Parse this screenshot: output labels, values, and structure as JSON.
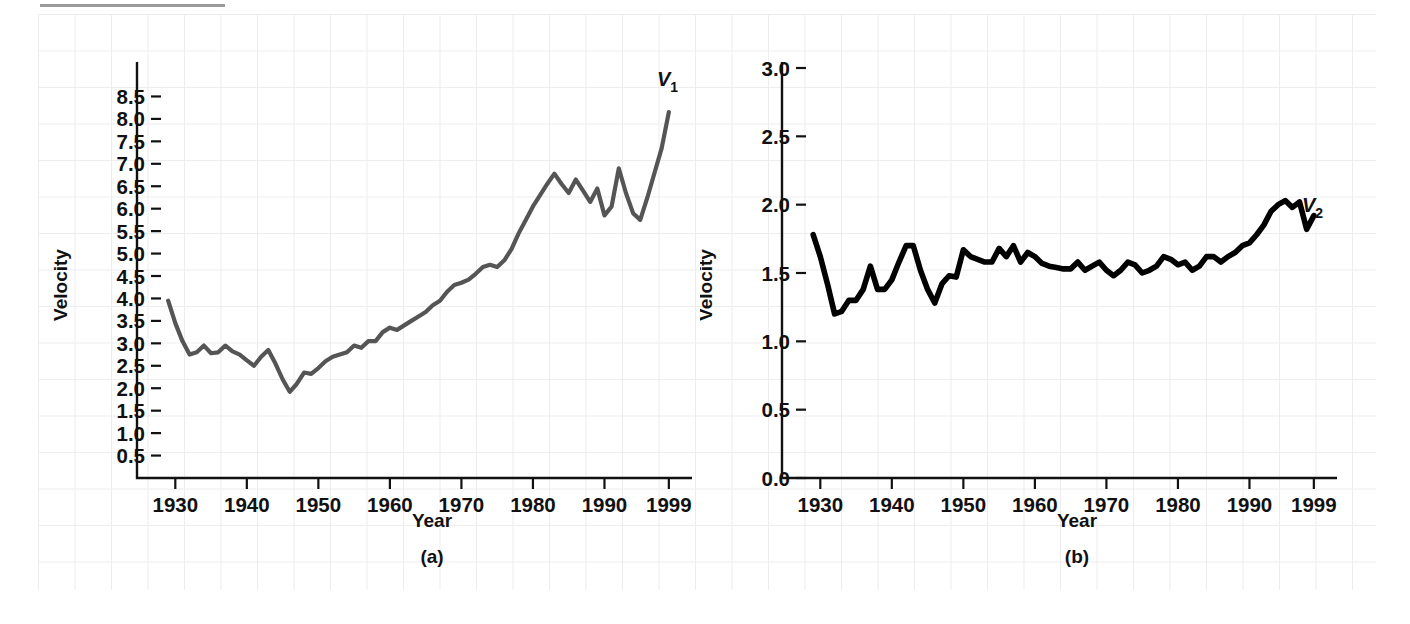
{
  "figure": {
    "panels": [
      {
        "caption": "(a)",
        "xlabel": "Year",
        "ylabel": "Velocity",
        "series_label": "V",
        "series_sub": "1",
        "line_color": "#555555"
      },
      {
        "caption": "(b)",
        "xlabel": "Year",
        "ylabel": "Velocity",
        "series_label": "V",
        "series_sub": "2",
        "line_color": "#000000"
      }
    ]
  },
  "chart_data": [
    {
      "type": "line",
      "title": "",
      "panel": "(a)",
      "xlabel": "Year",
      "ylabel": "Velocity",
      "xlim": [
        1928,
        2000
      ],
      "ylim": [
        0,
        8.8
      ],
      "grid": true,
      "legend_position": "end-of-line",
      "xticks": [
        1930,
        1940,
        1950,
        1960,
        1970,
        1980,
        1990,
        1999
      ],
      "xticklabels": [
        "1930",
        "1940",
        "1950",
        "1960",
        "1970",
        "1980",
        "1990",
        "1999"
      ],
      "yticks": [
        0.5,
        1.0,
        1.5,
        2.0,
        2.5,
        3.0,
        3.5,
        4.0,
        4.5,
        5.0,
        5.5,
        6.0,
        6.5,
        7.0,
        7.5,
        8.0,
        8.5
      ],
      "yticklabels": [
        "0.5",
        "1.0",
        "1.5",
        "2.0",
        "2.5",
        "3.0",
        "3.5",
        "4.0",
        "4.5",
        "5.0",
        "5.5",
        "6.0",
        "6.5",
        "7.0",
        "7.5",
        "8.0",
        "8.5"
      ],
      "series": [
        {
          "name": "V1",
          "annotation": "V₁",
          "x": [
            1929,
            1930,
            1931,
            1932,
            1933,
            1934,
            1935,
            1936,
            1937,
            1938,
            1939,
            1940,
            1941,
            1942,
            1943,
            1944,
            1945,
            1946,
            1947,
            1948,
            1949,
            1950,
            1951,
            1952,
            1953,
            1954,
            1955,
            1956,
            1957,
            1958,
            1959,
            1960,
            1961,
            1962,
            1963,
            1964,
            1965,
            1966,
            1967,
            1968,
            1969,
            1970,
            1971,
            1972,
            1973,
            1974,
            1975,
            1976,
            1977,
            1978,
            1979,
            1980,
            1981,
            1982,
            1983,
            1984,
            1985,
            1986,
            1987,
            1988,
            1989,
            1990,
            1991,
            1992,
            1993,
            1994,
            1995,
            1996,
            1997,
            1998,
            1999
          ],
          "values": [
            3.95,
            3.45,
            3.05,
            2.75,
            2.8,
            2.95,
            2.78,
            2.8,
            2.95,
            2.82,
            2.75,
            2.62,
            2.5,
            2.7,
            2.85,
            2.55,
            2.2,
            1.92,
            2.1,
            2.35,
            2.32,
            2.45,
            2.6,
            2.7,
            2.75,
            2.8,
            2.95,
            2.9,
            3.05,
            3.05,
            3.25,
            3.35,
            3.3,
            3.4,
            3.5,
            3.6,
            3.7,
            3.85,
            3.95,
            4.15,
            4.3,
            4.35,
            4.42,
            4.55,
            4.7,
            4.75,
            4.7,
            4.85,
            5.1,
            5.45,
            5.75,
            6.05,
            6.3,
            6.55,
            6.78,
            6.55,
            6.35,
            6.65,
            6.4,
            6.15,
            6.45,
            5.85,
            6.05,
            6.9,
            6.35,
            5.9,
            5.75,
            6.25,
            6.8,
            7.35,
            8.15
          ]
        }
      ]
    },
    {
      "type": "line",
      "title": "",
      "panel": "(b)",
      "xlabel": "Year",
      "ylabel": "Velocity",
      "xlim": [
        1928,
        2000
      ],
      "ylim": [
        0.0,
        3.0
      ],
      "grid": true,
      "legend_position": "end-of-line",
      "xticks": [
        1930,
        1940,
        1950,
        1960,
        1970,
        1980,
        1990,
        1999
      ],
      "xticklabels": [
        "1930",
        "1940",
        "1950",
        "1960",
        "1970",
        "1980",
        "1990",
        "1999"
      ],
      "yticks": [
        0.0,
        0.5,
        1.0,
        1.5,
        2.0,
        2.5,
        3.0
      ],
      "yticklabels": [
        "0.0",
        "0.5",
        "1.0",
        "1.5",
        "2.0",
        "2.5",
        "3.0"
      ],
      "series": [
        {
          "name": "V2",
          "annotation": "V₂",
          "x": [
            1929,
            1930,
            1931,
            1932,
            1933,
            1934,
            1935,
            1936,
            1937,
            1938,
            1939,
            1940,
            1941,
            1942,
            1943,
            1944,
            1945,
            1946,
            1947,
            1948,
            1949,
            1950,
            1951,
            1952,
            1953,
            1954,
            1955,
            1956,
            1957,
            1958,
            1959,
            1960,
            1961,
            1962,
            1963,
            1964,
            1965,
            1966,
            1967,
            1968,
            1969,
            1970,
            1971,
            1972,
            1973,
            1974,
            1975,
            1976,
            1977,
            1978,
            1979,
            1980,
            1981,
            1982,
            1983,
            1984,
            1985,
            1986,
            1987,
            1988,
            1989,
            1990,
            1991,
            1992,
            1993,
            1994,
            1995,
            1996,
            1997,
            1998,
            1999
          ],
          "values": [
            1.78,
            1.62,
            1.42,
            1.2,
            1.22,
            1.3,
            1.3,
            1.38,
            1.55,
            1.38,
            1.38,
            1.45,
            1.58,
            1.7,
            1.7,
            1.52,
            1.38,
            1.28,
            1.42,
            1.48,
            1.47,
            1.67,
            1.62,
            1.6,
            1.58,
            1.58,
            1.68,
            1.62,
            1.7,
            1.58,
            1.65,
            1.62,
            1.57,
            1.55,
            1.54,
            1.53,
            1.53,
            1.58,
            1.52,
            1.55,
            1.58,
            1.52,
            1.48,
            1.52,
            1.58,
            1.56,
            1.5,
            1.52,
            1.55,
            1.62,
            1.6,
            1.56,
            1.58,
            1.52,
            1.55,
            1.62,
            1.62,
            1.58,
            1.62,
            1.65,
            1.7,
            1.72,
            1.78,
            1.85,
            1.95,
            2.0,
            2.03,
            1.98,
            2.02,
            1.82,
            1.92
          ]
        }
      ]
    }
  ]
}
